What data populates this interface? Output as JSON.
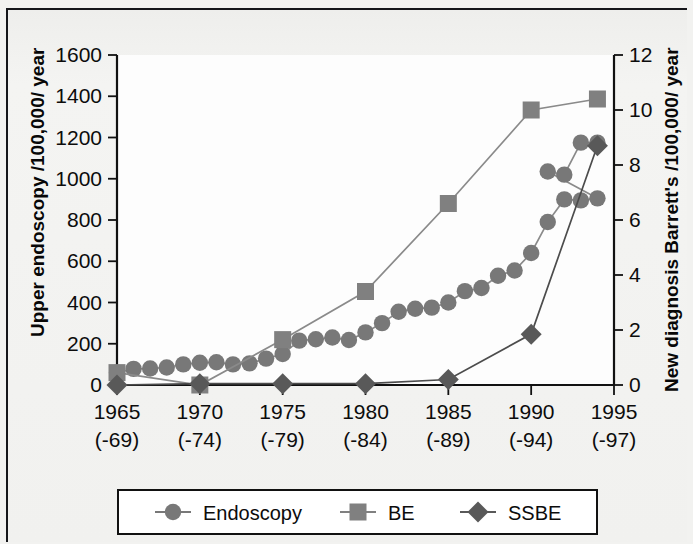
{
  "figure": {
    "background_color": "#f1f1ef",
    "plot_background_color": "#fdfdfd",
    "border_color": "#15161a"
  },
  "chart_data": {
    "type": "line",
    "title": "",
    "xlabel": "",
    "ylabel": "Upper endoscopy /100,000/ year",
    "y2label": "New diagnosis Barrett's /100,000/ year",
    "grid": false,
    "legend_position": "bottom",
    "xlim": [
      1965,
      1995
    ],
    "ylim": [
      0,
      1600
    ],
    "y2lim": [
      0,
      12
    ],
    "yticks": [
      0,
      200,
      400,
      600,
      800,
      1000,
      1200,
      1400,
      1600
    ],
    "ytick_labels": [
      "0",
      "200",
      "400",
      "600",
      "800",
      "1000",
      "1200",
      "1400",
      "1600"
    ],
    "y2ticks": [
      0,
      2,
      4,
      6,
      8,
      10,
      12
    ],
    "y2tick_labels": [
      "0",
      "2",
      "4",
      "6",
      "8",
      "10",
      "12"
    ],
    "xticks": [
      1965,
      1970,
      1975,
      1980,
      1985,
      1990,
      1995
    ],
    "xtick_labels": [
      "1965",
      "1970",
      "1975",
      "1980",
      "1985",
      "1990",
      "1995"
    ],
    "xtick_sublabels": [
      "(-69)",
      "(-74)",
      "(-79)",
      "(-84)",
      "(-89)",
      "(-94)",
      "(-97)"
    ],
    "series": [
      {
        "name": "Endoscopy",
        "axis": "left",
        "marker": "circle",
        "color": "#787878",
        "line_color": "#8a8a8a",
        "x": [
          1965,
          1966,
          1967,
          1968,
          1969,
          1970,
          1971,
          1972,
          1973,
          1974,
          1975,
          1976,
          1977,
          1978,
          1979,
          1980,
          1981,
          1982,
          1983,
          1984,
          1985,
          1986,
          1987,
          1988,
          1989,
          1990,
          1991,
          1992,
          1993,
          1994
        ],
        "values": [
          60,
          78,
          80,
          85,
          100,
          108,
          110,
          100,
          105,
          128,
          150,
          215,
          222,
          230,
          218,
          255,
          300,
          355,
          370,
          375,
          400,
          455,
          470,
          530,
          555,
          640,
          790,
          900,
          895,
          905
        ]
      },
      {
        "name": "BE",
        "axis": "right",
        "marker": "square",
        "color": "#808080",
        "line_color": "#8a8a8a",
        "x": [
          1965,
          1970,
          1975,
          1980,
          1985,
          1990,
          1994
        ],
        "values": [
          0.45,
          0.0,
          1.65,
          3.4,
          6.6,
          10.0,
          10.4
        ]
      },
      {
        "name": "SSBE",
        "axis": "right",
        "marker": "diamond",
        "color": "#595959",
        "line_color": "#4c4c4c",
        "x": [
          1965,
          1970,
          1975,
          1980,
          1985,
          1990,
          1994
        ],
        "values": [
          0.0,
          0.05,
          0.05,
          0.05,
          0.2,
          1.85,
          8.7
        ]
      }
    ],
    "endoscopy_tail": {
      "x": [
        1991,
        1992,
        1993,
        1994
      ],
      "values": [
        1035,
        1020,
        1175,
        1175
      ]
    },
    "legend": [
      {
        "label": "Endoscopy",
        "marker": "circle",
        "color": "#787878"
      },
      {
        "label": "BE",
        "marker": "square",
        "color": "#808080"
      },
      {
        "label": "SSBE",
        "marker": "diamond",
        "color": "#595959"
      }
    ]
  }
}
